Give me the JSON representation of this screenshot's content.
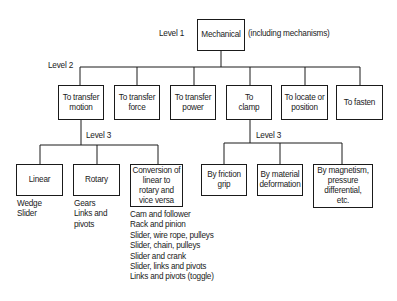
{
  "diagram": {
    "level1": {
      "label": "Level 1",
      "box": "Mechanical",
      "note": "(including mechanisms)"
    },
    "level2": {
      "label": "Level 2",
      "boxes": [
        "To transfer\nmotion",
        "To transfer\nforce",
        "To transfer\npower",
        "To\nclamp",
        "To locate or\nposition",
        "To fasten"
      ]
    },
    "level3_motion": {
      "label": "Level 3",
      "boxes": [
        "Linear",
        "Rotary",
        "Conversion of\nlinear to\nrotary and\nvice versa"
      ],
      "linear_examples": [
        "Wedge",
        "Slider"
      ],
      "rotary_examples": [
        "Gears",
        "Links and",
        "pivots"
      ],
      "conversion_examples": [
        "Cam and follower",
        "Rack and pinion",
        "Slider, wire rope, pulleys",
        "Slider, chain, pulleys",
        "Slider and crank",
        "Slider, links and pivots",
        "Links and pivots (toggle)"
      ]
    },
    "level3_clamp": {
      "label": "Level 3",
      "boxes": [
        "By friction\ngrip",
        "By material\ndeformation",
        "By magnetism,\npressure\ndifferential,\netc."
      ]
    }
  }
}
